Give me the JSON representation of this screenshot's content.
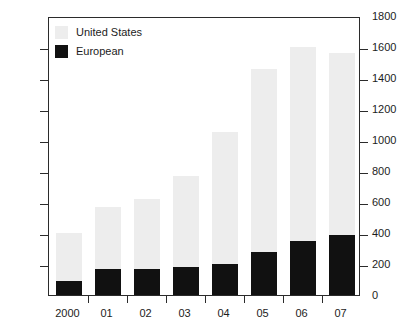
{
  "chart_data": {
    "type": "bar",
    "subtype": "stacked-vertical",
    "title": "",
    "xlabel": "",
    "ylabel": "",
    "categories": [
      "2000",
      "01",
      "02",
      "03",
      "04",
      "05",
      "06",
      "07"
    ],
    "series": [
      {
        "name": "European",
        "color": "#111111",
        "values": [
          90,
          170,
          165,
          180,
          200,
          280,
          350,
          390
        ]
      },
      {
        "name": "United States",
        "color": "#ededed",
        "values": [
          310,
          400,
          455,
          590,
          850,
          1180,
          1250,
          1170
        ]
      }
    ],
    "totals": [
      400,
      570,
      620,
      770,
      1050,
      1460,
      1600,
      1560
    ],
    "ylim": [
      0,
      1800
    ],
    "yticks": [
      0,
      200,
      400,
      600,
      800,
      1000,
      1200,
      1400,
      1600,
      1800
    ],
    "ytick_labels": [
      "0",
      "200",
      "400",
      "600",
      "800",
      "1000",
      "1200",
      "1400",
      "1600",
      "1800"
    ],
    "y_axis_position": "right",
    "grid": false,
    "legend": {
      "position": "top-left",
      "entries": [
        {
          "label": "United States",
          "color": "#ededed"
        },
        {
          "label": "European",
          "color": "#111111"
        }
      ]
    }
  },
  "colors": {
    "united_states": "#ededed",
    "european": "#111111",
    "axis": "#2b2b2b",
    "text": "#1c1c1c",
    "background": "#ffffff"
  }
}
